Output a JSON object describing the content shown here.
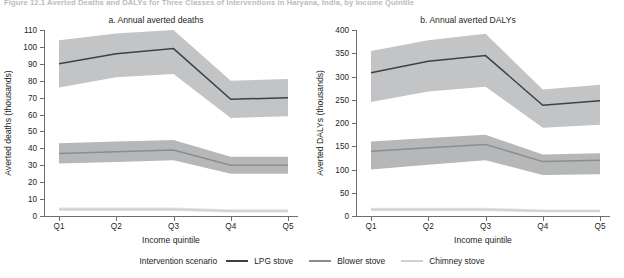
{
  "figure": {
    "caption": "Figure 12.1  Averted Deaths and DALYs for Three Classes of Interventions in Haryana, India, by Income Quintile"
  },
  "legend": {
    "title": "Intervention scenario",
    "items": [
      {
        "label": "LPG stove",
        "color": "#404040"
      },
      {
        "label": "Blower stove",
        "color": "#8c8c8c"
      },
      {
        "label": "Chimney stove",
        "color": "#cfcfcf"
      }
    ]
  },
  "chart_data": [
    {
      "type": "line",
      "title": "a. Annual averted deaths",
      "xlabel": "Income quintile",
      "ylabel": "Averted deaths (thousands)",
      "categories": [
        "Q1",
        "Q2",
        "Q3",
        "Q4",
        "Q5"
      ],
      "ylim": [
        0,
        110
      ],
      "yticks": [
        0,
        10,
        20,
        30,
        40,
        50,
        60,
        70,
        80,
        90,
        100,
        110
      ],
      "grid": false,
      "legend_position": "bottom",
      "series": [
        {
          "name": "LPG stove",
          "color": "#404040",
          "values": [
            90,
            96,
            99,
            69,
            70
          ],
          "lower": [
            76,
            82,
            84,
            58,
            59
          ],
          "upper": [
            104,
            108,
            110,
            80,
            81
          ],
          "band_color": "#c2c4c6"
        },
        {
          "name": "Blower stove",
          "color": "#8c8c8c",
          "values": [
            37,
            38,
            39,
            30,
            30
          ],
          "lower": [
            31,
            32,
            33,
            25,
            25
          ],
          "upper": [
            43,
            44,
            45,
            35,
            35
          ],
          "band_color": "#b5b7b9"
        },
        {
          "name": "Chimney stove",
          "color": "#cfcfcf",
          "values": [
            4,
            4,
            4,
            3,
            3
          ],
          "lower": [
            3,
            3,
            3,
            2,
            2
          ],
          "upper": [
            5,
            5,
            5,
            4,
            4
          ],
          "band_color": "#e2e3e4"
        }
      ]
    },
    {
      "type": "line",
      "title": "b. Annual averted DALYs",
      "xlabel": "Income quintile",
      "ylabel": "Averted DALYs (thousands)",
      "categories": [
        "Q1",
        "Q2",
        "Q3",
        "Q4",
        "Q5"
      ],
      "ylim": [
        0,
        400
      ],
      "yticks": [
        0,
        50,
        100,
        150,
        200,
        250,
        300,
        350,
        400
      ],
      "grid": false,
      "legend_position": "bottom",
      "series": [
        {
          "name": "LPG stove",
          "color": "#404040",
          "values": [
            308,
            333,
            345,
            238,
            248
          ],
          "lower": [
            245,
            268,
            278,
            190,
            196
          ],
          "upper": [
            355,
            378,
            392,
            272,
            282
          ],
          "band_color": "#c2c4c6"
        },
        {
          "name": "Blower stove",
          "color": "#8c8c8c",
          "values": [
            139,
            147,
            154,
            117,
            120
          ],
          "lower": [
            100,
            110,
            120,
            88,
            90
          ],
          "upper": [
            160,
            168,
            175,
            132,
            135
          ],
          "band_color": "#b5b7b9"
        },
        {
          "name": "Chimney stove",
          "color": "#cfcfcf",
          "values": [
            14,
            14,
            14,
            11,
            11
          ],
          "lower": [
            10,
            10,
            10,
            8,
            8
          ],
          "upper": [
            18,
            18,
            18,
            14,
            14
          ],
          "band_color": "#e2e3e4"
        }
      ]
    }
  ]
}
